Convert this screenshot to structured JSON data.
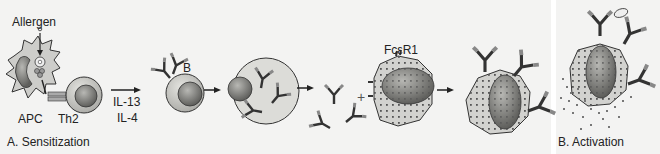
{
  "panels": {
    "a": {
      "title": "A. Sensitization"
    },
    "b": {
      "title": "B. Activation"
    }
  },
  "labels": {
    "allergen": "Allergen",
    "apc": "APC",
    "th2": "Th2",
    "cytokine1": "IL-13",
    "cytokine2": "IL-4",
    "b_cell": "B",
    "receptor": "FcεR1",
    "plus": "+"
  },
  "colors": {
    "background": "#f3f3f2",
    "cell_fill": "#c9c9c6",
    "cell_light": "#dcdcd8",
    "nucleus": "#7a7a77",
    "granule": "#555555",
    "stroke": "#333333"
  }
}
